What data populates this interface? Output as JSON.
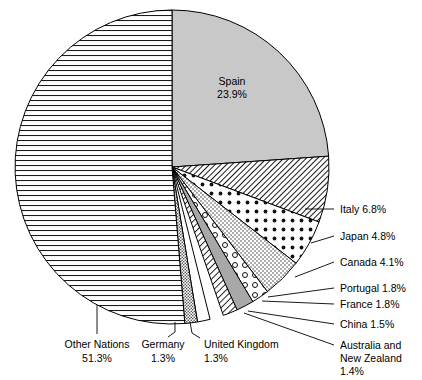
{
  "chart_data": {
    "type": "pie",
    "title": "",
    "subtitle": "",
    "xlabel": "",
    "ylabel": "",
    "legend_position": "none",
    "grid": false,
    "units": "percent",
    "start_angle_deg": 0,
    "direction": "clockwise",
    "categories": [
      "Spain",
      "Italy",
      "Japan",
      "Canada",
      "Portugal",
      "France",
      "China",
      "Australia and New Zealand",
      "United Kingdom",
      "Germany",
      "Other Nations"
    ],
    "values": [
      23.9,
      6.8,
      4.8,
      4.1,
      1.8,
      1.8,
      1.5,
      1.4,
      1.3,
      1.3,
      51.3
    ],
    "slices": [
      {
        "name": "Spain",
        "label": "Spain",
        "value": 23.9,
        "value_text": "23.9%",
        "pattern": "solid-gray",
        "fill": "#c8c8c8",
        "label_placement": "inside",
        "label_lines": [
          "Spain",
          "23.9%"
        ]
      },
      {
        "name": "Italy",
        "label": "Italy",
        "value": 6.8,
        "value_text": "6.8%",
        "pattern": "diagonal-hatch-dense",
        "fill": "#ffffff",
        "label_placement": "callout-right",
        "label_lines": [
          "Italy 6.8%"
        ]
      },
      {
        "name": "Japan",
        "label": "Japan",
        "value": 4.8,
        "value_text": "4.8%",
        "pattern": "polka-dots",
        "fill": "#ffffff",
        "label_placement": "callout-right",
        "label_lines": [
          "Japan 4.8%"
        ]
      },
      {
        "name": "Canada",
        "label": "Canada",
        "value": 4.1,
        "value_text": "4.1%",
        "pattern": "fine-stipple",
        "fill": "#ffffff",
        "label_placement": "callout-right",
        "label_lines": [
          "Canada 4.1%"
        ]
      },
      {
        "name": "Portugal",
        "label": "Portugal",
        "value": 1.8,
        "value_text": "1.8%",
        "pattern": "open-circles",
        "fill": "#ffffff",
        "label_placement": "callout-right",
        "label_lines": [
          "Portugal 1.8%"
        ]
      },
      {
        "name": "France",
        "label": "France",
        "value": 1.8,
        "value_text": "1.8%",
        "pattern": "solid-gray",
        "fill": "#a8a8a8",
        "label_placement": "callout-right",
        "label_lines": [
          "France 1.8%"
        ]
      },
      {
        "name": "China",
        "label": "China",
        "value": 1.5,
        "value_text": "1.5%",
        "pattern": "diagonal-hatch-wide",
        "fill": "#ffffff",
        "label_placement": "callout-right",
        "label_lines": [
          "China 1.5%"
        ]
      },
      {
        "name": "Australia and New Zealand",
        "label": "Australia and New Zealand",
        "value": 1.4,
        "value_text": "1.4%",
        "pattern": "blank",
        "fill": "#ffffff",
        "label_placement": "callout-right",
        "label_lines": [
          "Australia and",
          "New Zealand",
          "1.4%"
        ]
      },
      {
        "name": "United Kingdom",
        "label": "United Kingdom",
        "value": 1.3,
        "value_text": "1.3%",
        "pattern": "blank",
        "fill": "#ffffff",
        "label_placement": "callout-bottom",
        "label_lines": [
          "United Kingdom",
          "1.3%"
        ]
      },
      {
        "name": "Germany",
        "label": "Germany",
        "value": 1.3,
        "value_text": "1.3%",
        "pattern": "dense-speckle",
        "fill": "#ffffff",
        "label_placement": "callout-bottom",
        "label_lines": [
          "Germany",
          "1.3%"
        ]
      },
      {
        "name": "Other Nations",
        "label": "Other Nations",
        "value": 51.3,
        "value_text": "51.3%",
        "pattern": "horizontal-lines",
        "fill": "#ffffff",
        "label_placement": "callout-bottom",
        "label_lines": [
          "Other Nations",
          "51.3%"
        ]
      }
    ]
  },
  "labels": {
    "spain_name": "Spain",
    "spain_pct": "23.9%",
    "italy": "Italy 6.8%",
    "japan": "Japan 4.8%",
    "canada": "Canada 4.1%",
    "portugal": "Portugal 1.8%",
    "france": "France 1.8%",
    "china": "China 1.5%",
    "anz_line1": "Australia and",
    "anz_line2": "New Zealand",
    "anz_line3": "1.4%",
    "uk_line1": "United Kingdom",
    "uk_line2": "1.3%",
    "germany_line1": "Germany",
    "germany_line2": "1.3%",
    "other_line1": "Other Nations",
    "other_line2": "51.3%"
  },
  "colors": {
    "stroke": "#000000",
    "spain_fill": "#c8c8c8",
    "france_fill": "#a8a8a8",
    "background": "#ffffff"
  }
}
